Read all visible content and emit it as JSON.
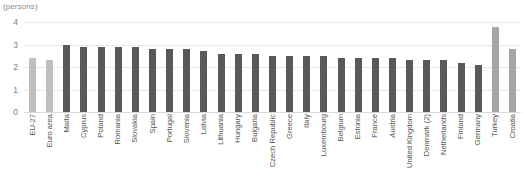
{
  "chart_data": {
    "type": "bar",
    "title": "",
    "subtitle": "",
    "xlabel": "",
    "ylabel": "(persons)",
    "unit_label": "(persons)",
    "ylim": [
      0,
      4
    ],
    "yticks": [
      0,
      1,
      2,
      3,
      4
    ],
    "ytick_labels": [
      "0",
      "1",
      "2",
      "3",
      "4"
    ],
    "grid": true,
    "grid_axis": "y",
    "legend": false,
    "legend_position": "none",
    "categories": [
      "EU-27",
      "Euro area",
      "Malta",
      "Cyprus",
      "Poland",
      "Romania",
      "Slovakia",
      "Spain",
      "Portugal",
      "Slovenia",
      "Latvia",
      "Lithuania",
      "Hungary",
      "Bulgaria",
      "Czech Republic",
      "Greece",
      "Italy",
      "Luxembourg",
      "Belgium",
      "Estonia",
      "France",
      "Austria",
      "United Kingdom",
      "Denmark (2)",
      "Netherlands",
      "Finland",
      "Germany",
      "Turkey",
      "Croatia"
    ],
    "values": [
      2.4,
      2.3,
      3.0,
      2.9,
      2.9,
      2.9,
      2.9,
      2.8,
      2.8,
      2.8,
      2.7,
      2.6,
      2.6,
      2.6,
      2.5,
      2.5,
      2.5,
      2.5,
      2.4,
      2.4,
      2.4,
      2.4,
      2.3,
      2.3,
      2.3,
      2.2,
      2.1,
      3.8,
      2.8
    ],
    "bar_colors": [
      "#bfbfbf",
      "#bfbfbf",
      "#595959",
      "#595959",
      "#595959",
      "#595959",
      "#595959",
      "#595959",
      "#595959",
      "#595959",
      "#595959",
      "#595959",
      "#595959",
      "#595959",
      "#595959",
      "#595959",
      "#595959",
      "#595959",
      "#595959",
      "#595959",
      "#595959",
      "#595959",
      "#595959",
      "#595959",
      "#595959",
      "#595959",
      "#595959",
      "#a6a6a6",
      "#a6a6a6"
    ],
    "colors": {
      "aggregate": "#bfbfbf",
      "member_state": "#595959",
      "candidate": "#a6a6a6",
      "gridline": "#e8e8e8",
      "axis_text": "#808080",
      "label_text": "#555555",
      "background": "#ffffff"
    }
  }
}
